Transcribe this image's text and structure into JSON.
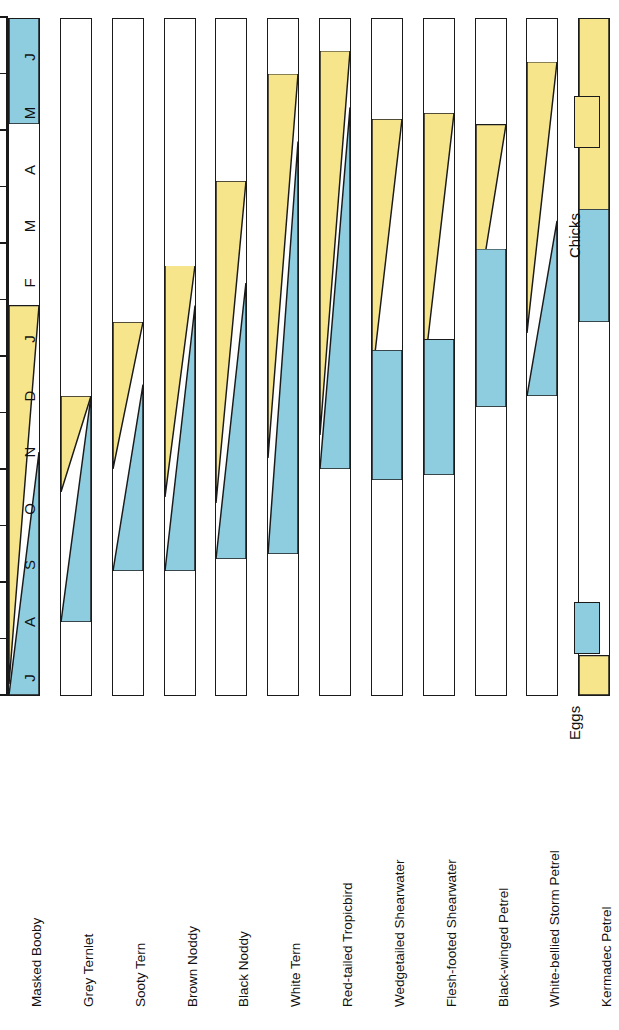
{
  "chart_data": {
    "type": "bar",
    "title": "",
    "xlabel": "",
    "ylabel": "",
    "orientation": "horizontal-rotated",
    "grid": false,
    "legend_position": "right",
    "months": [
      "J",
      "A",
      "S",
      "O",
      "N",
      "D",
      "J",
      "F",
      "M",
      "A",
      "M",
      "J"
    ],
    "month_names": [
      "Jul",
      "Aug",
      "Sep",
      "Oct",
      "Nov",
      "Dec",
      "Jan",
      "Feb",
      "Mar",
      "Apr",
      "May",
      "Jun"
    ],
    "xlim": [
      0,
      12
    ],
    "legend": [
      {
        "label": "Eggs",
        "color": "#8ecde0"
      },
      {
        "label": "Chicks",
        "color": "#f7e58c"
      }
    ],
    "categories": [
      "Masked Booby",
      "Grey Ternlet",
      "Sooty Tern",
      "Brown Noddy",
      "Black Noddy",
      "White Tern",
      "Red-tailed Tropicbird",
      "Wedgetailed Shearwater",
      "Flesh-footed Shearwater",
      "Black-winged Petrel",
      "White-bellied Storm Petrel",
      "Kermadec Petrel",
      "Providence Petrel",
      "Little Shearwater"
    ],
    "series": [
      {
        "name": "Masked Booby",
        "eggs": [
          {
            "start": 0.0,
            "end": 4.3,
            "taper": "shrink-up"
          },
          {
            "start": 10.1,
            "end": 12.0,
            "taper": "none"
          }
        ],
        "chicks": [
          {
            "start": 0.2,
            "end": 6.9,
            "taper": "grow-up"
          }
        ]
      },
      {
        "name": "Grey Ternlet",
        "eggs": [
          {
            "start": 1.3,
            "end": 5.3,
            "taper": "shrink-up"
          }
        ],
        "chicks": [
          {
            "start": 3.6,
            "end": 5.3,
            "taper": "grow-up"
          }
        ]
      },
      {
        "name": "Sooty Tern",
        "eggs": [
          {
            "start": 2.2,
            "end": 5.5,
            "taper": "shrink-up"
          }
        ],
        "chicks": [
          {
            "start": 4.0,
            "end": 6.6,
            "taper": "grow-up"
          }
        ]
      },
      {
        "name": "Brown Noddy",
        "eggs": [
          {
            "start": 2.2,
            "end": 6.9,
            "taper": "shrink-up"
          }
        ],
        "chicks": [
          {
            "start": 3.5,
            "end": 7.6,
            "taper": "grow-up"
          }
        ]
      },
      {
        "name": "Black Noddy",
        "eggs": [
          {
            "start": 2.4,
            "end": 7.3,
            "taper": "shrink-up"
          }
        ],
        "chicks": [
          {
            "start": 3.4,
            "end": 9.1,
            "taper": "grow-up"
          }
        ]
      },
      {
        "name": "White Tern",
        "eggs": [
          {
            "start": 2.5,
            "end": 9.8,
            "taper": "shrink-up"
          }
        ],
        "chicks": [
          {
            "start": 4.2,
            "end": 11.0,
            "taper": "grow-up"
          }
        ]
      },
      {
        "name": "Red-tailed Tropicbird",
        "eggs": [
          {
            "start": 4.0,
            "end": 10.4,
            "taper": "shrink-up"
          }
        ],
        "chicks": [
          {
            "start": 4.6,
            "end": 11.4,
            "taper": "grow-up"
          }
        ]
      },
      {
        "name": "Wedgetailed Shearwater",
        "eggs": [
          {
            "start": 3.8,
            "end": 6.1,
            "taper": "none"
          }
        ],
        "chicks": [
          {
            "start": 5.6,
            "end": 10.2,
            "taper": "grow-up"
          }
        ]
      },
      {
        "name": "Flesh-footed Shearwater",
        "eggs": [
          {
            "start": 3.9,
            "end": 6.3,
            "taper": "none"
          }
        ],
        "chicks": [
          {
            "start": 5.7,
            "end": 10.3,
            "taper": "grow-up"
          }
        ]
      },
      {
        "name": "Black-winged Petrel",
        "eggs": [
          {
            "start": 5.1,
            "end": 7.9,
            "taper": "none"
          }
        ],
        "chicks": [
          {
            "start": 6.8,
            "end": 10.1,
            "taper": "grow-up"
          }
        ]
      },
      {
        "name": "White-bellied Storm Petrel",
        "eggs": [
          {
            "start": 5.3,
            "end": 8.4,
            "taper": "shrink-up"
          }
        ],
        "chicks": [
          {
            "start": 6.4,
            "end": 11.2,
            "taper": "grow-up"
          }
        ]
      },
      {
        "name": "Kermadec Petrel",
        "eggs": [
          {
            "start": 6.6,
            "end": 8.6,
            "taper": "none"
          }
        ],
        "chicks": [
          {
            "start": 0.0,
            "end": 0.7,
            "taper": "none"
          },
          {
            "start": 7.9,
            "end": 12.0,
            "taper": "none"
          }
        ]
      },
      {
        "name": "Providence Petrel",
        "eggs": [
          {
            "start": 0.0,
            "end": 0.9,
            "taper": "grow-up"
          },
          {
            "start": 10.0,
            "end": 12.0,
            "taper": "none"
          }
        ],
        "chicks": [
          {
            "start": 0.0,
            "end": 4.5,
            "taper": "none"
          }
        ]
      },
      {
        "name": "Little Shearwater",
        "eggs": [
          {
            "start": 0.2,
            "end": 2.9,
            "taper": "shrink-up"
          }
        ],
        "chicks": [
          {
            "start": 0.9,
            "end": 4.5,
            "taper": "none"
          }
        ]
      }
    ]
  },
  "colors": {
    "eggs": "#8ecde0",
    "chicks": "#f7e58c",
    "outline": "#1a1a1a",
    "background": "#ffffff"
  }
}
